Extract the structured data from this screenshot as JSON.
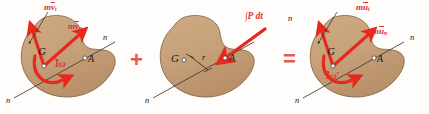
{
  "figure": {
    "colors": {
      "body_fill": "#c9a47c",
      "body_fill_shade": "#b8906a",
      "body_stroke": "#6e5336",
      "vector_red": "#e8281e",
      "label_red": "#d7342a",
      "operator_red": "#e05b52",
      "axis_line": "#3a3a38",
      "text_dark": "#1d1a17",
      "background": "#fefdfb"
    },
    "operators": {
      "plus": "+",
      "equals": "="
    },
    "panels": [
      {
        "id": "initial-momentum",
        "role": "initial momentum diagram",
        "labels": {
          "center_of_mass": "G",
          "point_a": "A",
          "axis_upper": "n",
          "axis_lower": "n",
          "vector_tangential": "mv",
          "vector_tangential_sub": "t",
          "vector_normal": "mv",
          "vector_normal_sub": "n",
          "angular": "I",
          "angular_omega": "ω"
        }
      },
      {
        "id": "impulse",
        "role": "impulse diagram",
        "labels": {
          "center_of_mass": "G",
          "point_a": "A",
          "axis_upper": "n",
          "axis_lower": "n",
          "moment_arm": "r",
          "impulse": "∫P dt"
        }
      },
      {
        "id": "final-momentum",
        "role": "final momentum diagram",
        "labels": {
          "center_of_mass": "G",
          "point_a": "A",
          "axis_upper": "n",
          "axis_lower": "n",
          "vector_tangential": "mu",
          "vector_tangential_sub": "t",
          "vector_normal": "mu",
          "vector_normal_sub": "n",
          "angular": "I",
          "angular_omega": "ω′"
        }
      }
    ]
  }
}
